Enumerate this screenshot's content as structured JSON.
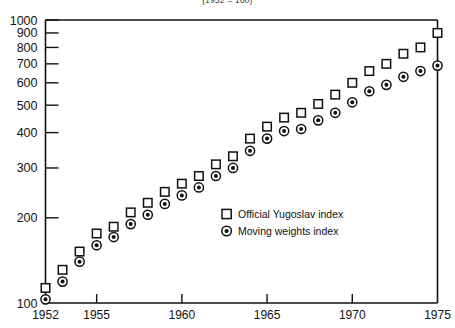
{
  "chart_data": {
    "type": "scatter",
    "title": "(1952 = 100)",
    "xlabel": "",
    "ylabel": "",
    "xlim": [
      1952,
      1975
    ],
    "ylim": [
      100,
      1000
    ],
    "yscale": "log",
    "grid": false,
    "legend_position": "center-right",
    "x": [
      1952,
      1953,
      1954,
      1955,
      1956,
      1957,
      1958,
      1959,
      1960,
      1961,
      1962,
      1963,
      1964,
      1965,
      1966,
      1967,
      1968,
      1969,
      1970,
      1971,
      1972,
      1973,
      1974,
      1975
    ],
    "ytick_labels": [
      "100",
      "200",
      "300",
      "400",
      "500",
      "600",
      "700",
      "800",
      "900",
      "1000"
    ],
    "ytick_values": [
      100,
      200,
      300,
      400,
      500,
      600,
      700,
      800,
      900,
      1000
    ],
    "xtick_labels": [
      "1952",
      "1955",
      "1960",
      "1965",
      "1970",
      "1975"
    ],
    "xtick_values": [
      1952,
      1955,
      1960,
      1965,
      1970,
      1975
    ],
    "series": [
      {
        "name": "Official Yugoslav index",
        "marker": "open-square",
        "values": [
          113,
          131,
          152,
          176,
          186,
          209,
          226,
          247,
          264,
          281,
          309,
          330,
          381,
          420,
          452,
          470,
          505,
          545,
          600,
          660,
          700,
          760,
          800,
          900
        ]
      },
      {
        "name": "Moving weights index",
        "marker": "circled-dot",
        "values": [
          103,
          119,
          140,
          160,
          171,
          190,
          205,
          224,
          240,
          256,
          281,
          300,
          345,
          381,
          405,
          412,
          442,
          470,
          512,
          560,
          590,
          630,
          660,
          690
        ]
      }
    ]
  },
  "legend": {
    "items": [
      {
        "label": "Official Yugoslav index",
        "marker": "open-square"
      },
      {
        "label": "Moving weights index",
        "marker": "circled-dot"
      }
    ]
  }
}
